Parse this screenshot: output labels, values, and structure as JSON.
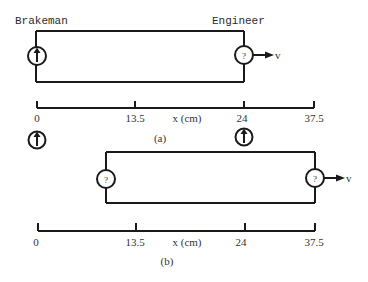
{
  "figure": {
    "panel_a": {
      "caption": "(a)",
      "labels": {
        "left_observer": "Brakeman",
        "right_observer": "Engineer"
      },
      "train": {
        "left_clock": {
          "display": "hand-up",
          "text": ""
        },
        "right_clock": {
          "display": "unknown",
          "text": "?"
        },
        "velocity_label": "v"
      },
      "axis": {
        "label": "x (cm)",
        "ticks": [
          "0",
          "13.5",
          "24",
          "37.5"
        ]
      },
      "ground_clocks": [
        {
          "position": "0",
          "display": "hand-up"
        },
        {
          "position": "24",
          "display": "hand-up"
        }
      ]
    },
    "panel_b": {
      "caption": "(b)",
      "train": {
        "left_clock": {
          "display": "unknown",
          "text": "?"
        },
        "right_clock": {
          "display": "unknown",
          "text": "?"
        },
        "velocity_label": "v"
      },
      "axis": {
        "label": "x (cm)",
        "ticks": [
          "0",
          "13.5",
          "24",
          "37.5"
        ]
      }
    },
    "colors": {
      "ink": "#1a1a1a",
      "background": "#ffffff"
    }
  }
}
